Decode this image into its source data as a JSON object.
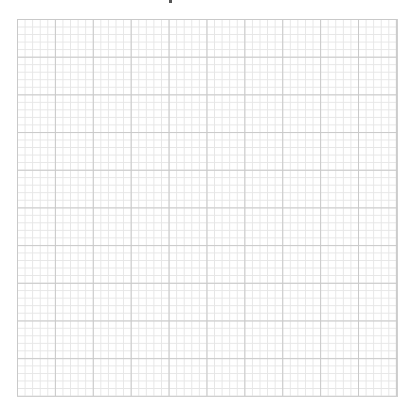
{
  "page": {
    "grid": {
      "major_divisions_x": 10,
      "major_divisions_y": 10,
      "minor_per_major": 5,
      "major_line_color": "#c9c9c9",
      "minor_line_color": "#e6e6e6",
      "background_color": "#ffffff"
    }
  }
}
